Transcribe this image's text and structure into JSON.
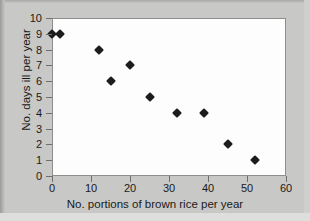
{
  "chart_data": {
    "type": "scatter",
    "title": "",
    "xlabel": "No. portions of brown rice per year",
    "ylabel": "No. days ill per year",
    "xlim": [
      0,
      60
    ],
    "ylim": [
      0,
      10
    ],
    "xticks": [
      0,
      10,
      20,
      30,
      40,
      50,
      60
    ],
    "yticks": [
      0,
      1,
      2,
      3,
      4,
      5,
      6,
      7,
      8,
      9,
      10
    ],
    "grid": false,
    "legend": null,
    "marker": "filled-diamond",
    "marker_color": "#1c1c1c",
    "points": [
      {
        "x": 0,
        "y": 9
      },
      {
        "x": 2,
        "y": 9
      },
      {
        "x": 12,
        "y": 8
      },
      {
        "x": 15,
        "y": 6
      },
      {
        "x": 20,
        "y": 7
      },
      {
        "x": 25,
        "y": 5
      },
      {
        "x": 32,
        "y": 4
      },
      {
        "x": 39,
        "y": 4
      },
      {
        "x": 45,
        "y": 2
      },
      {
        "x": 52,
        "y": 1
      }
    ]
  },
  "figure": {
    "background_color": "#c8c8c6",
    "plot_background_color": "#fdfdfd",
    "frame_color": "#8d8d8b"
  }
}
